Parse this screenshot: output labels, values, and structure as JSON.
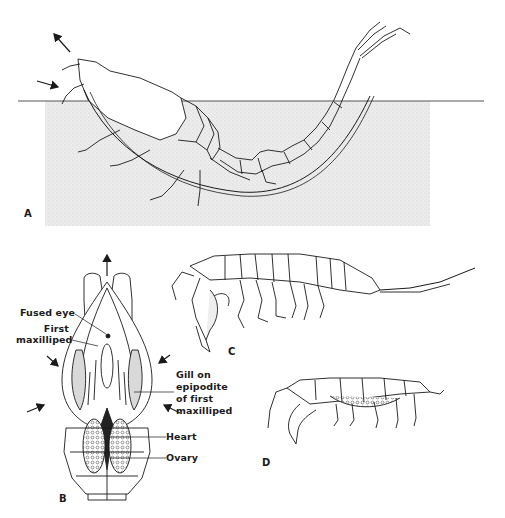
{
  "figure": {
    "panels": [
      {
        "id": "A",
        "letter": "A",
        "description": "lateral view of animal partially immersed below water surface"
      },
      {
        "id": "B",
        "letter": "B",
        "description": "dorsal view showing internal anatomy and water currents"
      },
      {
        "id": "C",
        "letter": "C",
        "description": "lateral view of amphipod-like crustacean"
      },
      {
        "id": "D",
        "letter": "D",
        "description": "lateral view of crustacean with curled appendages"
      }
    ],
    "labels": {
      "fused_eye": "Fused eye",
      "first_maxilliped_line1": "First",
      "first_maxilliped_line2": "maxilliped",
      "gill_line1": "Gill on",
      "gill_line2": "epipodite",
      "gill_line3": "of first",
      "gill_line4": "maxilliped",
      "heart": "Heart",
      "ovary": "Ovary"
    },
    "colors": {
      "ink": "#1a1a1a",
      "water_stipple": "#e6e6e6",
      "waterline": "#555555",
      "background": "#ffffff"
    }
  }
}
